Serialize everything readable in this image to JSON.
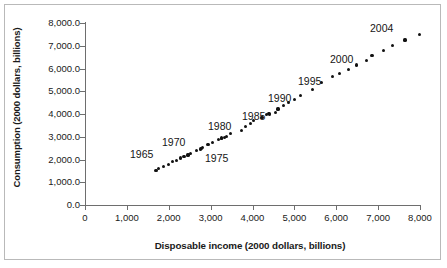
{
  "chart_data": {
    "type": "scatter",
    "title": "",
    "xlabel": "Disposable income (2000 dollars, billions)",
    "ylabel": "Consumption (2000 dollars, billions)",
    "xlim": [
      0,
      8000
    ],
    "ylim": [
      0,
      8000
    ],
    "grid": false,
    "legend": "none",
    "marker_color": "#111111",
    "axis_color": "#6e6e6e",
    "xticks": [
      "0",
      "1,000",
      "2,000",
      "3,000",
      "4,000",
      "5,000",
      "6,000",
      "7,000",
      "8,000"
    ],
    "xtick_values": [
      0,
      1000,
      2000,
      3000,
      4000,
      5000,
      6000,
      7000,
      8000
    ],
    "yticks": [
      "0.0",
      "1,000.0",
      "2,000.0",
      "3,000.0",
      "4,000.0",
      "5,000.0",
      "6,000.0",
      "7,000.0",
      "8,000.0"
    ],
    "ytick_values": [
      0,
      1000,
      2000,
      3000,
      4000,
      5000,
      6000,
      7000,
      8000
    ],
    "series_name": "Consumption vs. disposable income",
    "points": [
      {
        "year": 1962,
        "x": 1697,
        "y": 1531
      },
      {
        "year": 1963,
        "x": 1762,
        "y": 1589
      },
      {
        "year": 1964,
        "x": 1880,
        "y": 1685
      },
      {
        "year": 1965,
        "x": 1989,
        "y": 1792
      },
      {
        "year": 1966,
        "x": 2087,
        "y": 1900
      },
      {
        "year": 1967,
        "x": 2177,
        "y": 1959
      },
      {
        "year": 1968,
        "x": 2271,
        "y": 2070
      },
      {
        "year": 1969,
        "x": 2366,
        "y": 2148
      },
      {
        "year": 1970,
        "x": 2459,
        "y": 2198
      },
      {
        "year": 1971,
        "x": 2526,
        "y": 2280
      },
      {
        "year": 1972,
        "x": 2653,
        "y": 2406
      },
      {
        "year": 1973,
        "x": 2791,
        "y": 2496
      },
      {
        "year": 1974,
        "x": 2753,
        "y": 2465
      },
      {
        "year": 1975,
        "x": 2810,
        "y": 2517
      },
      {
        "year": 1976,
        "x": 2939,
        "y": 2649
      },
      {
        "year": 1977,
        "x": 3039,
        "y": 2765
      },
      {
        "year": 1978,
        "x": 3187,
        "y": 2885
      },
      {
        "year": 1979,
        "x": 3259,
        "y": 2949
      },
      {
        "year": 1980,
        "x": 3264,
        "y": 2930
      },
      {
        "year": 1981,
        "x": 3337,
        "y": 2959
      },
      {
        "year": 1982,
        "x": 3377,
        "y": 3003
      },
      {
        "year": 1983,
        "x": 3475,
        "y": 3141
      },
      {
        "year": 1984,
        "x": 3736,
        "y": 3288
      },
      {
        "year": 1985,
        "x": 3839,
        "y": 3453
      },
      {
        "year": 1986,
        "x": 3958,
        "y": 3585
      },
      {
        "year": 1987,
        "x": 4032,
        "y": 3704
      },
      {
        "year": 1988,
        "x": 4225,
        "y": 3863
      },
      {
        "year": 1989,
        "x": 4335,
        "y": 3962
      },
      {
        "year": 1990,
        "x": 4394,
        "y": 4014
      },
      {
        "year": 1991,
        "x": 4408,
        "y": 3980
      },
      {
        "year": 1992,
        "x": 4555,
        "y": 4079
      },
      {
        "year": 1993,
        "x": 4609,
        "y": 4217
      },
      {
        "year": 1994,
        "x": 4748,
        "y": 4378
      },
      {
        "year": 1995,
        "x": 4859,
        "y": 4495
      },
      {
        "year": 1996,
        "x": 4994,
        "y": 4650
      },
      {
        "year": 1997,
        "x": 5145,
        "y": 4812
      },
      {
        "year": 1998,
        "x": 5439,
        "y": 5080
      },
      {
        "year": 1999,
        "x": 5641,
        "y": 5372
      },
      {
        "year": 2000,
        "x": 5908,
        "y": 5642
      },
      {
        "year": 2001,
        "x": 6070,
        "y": 5780
      },
      {
        "year": 2002,
        "x": 6290,
        "y": 5944
      },
      {
        "year": 2003,
        "x": 6491,
        "y": 6150
      },
      {
        "year": 2004,
        "x": 6717,
        "y": 6353
      },
      {
        "year": 2005,
        "x": 6855,
        "y": 6570
      },
      {
        "year": 2006,
        "x": 7120,
        "y": 6800
      },
      {
        "year": 2007,
        "x": 7350,
        "y": 7020
      },
      {
        "year": 2008,
        "x": 7640,
        "y": 7250
      },
      {
        "year": 2009,
        "x": 7980,
        "y": 7490
      }
    ],
    "annotations": [
      {
        "label": "1965",
        "px": 130,
        "py": 148
      },
      {
        "label": "1970",
        "px": 162,
        "py": 136
      },
      {
        "label": "1975",
        "px": 205,
        "py": 152
      },
      {
        "label": "1980",
        "px": 208,
        "py": 120
      },
      {
        "label": "1985",
        "px": 242,
        "py": 110
      },
      {
        "label": "1990",
        "px": 268,
        "py": 92
      },
      {
        "label": "1995",
        "px": 298,
        "py": 75
      },
      {
        "label": "2000",
        "px": 330,
        "py": 53
      },
      {
        "label": "2004",
        "px": 370,
        "py": 22
      }
    ]
  }
}
